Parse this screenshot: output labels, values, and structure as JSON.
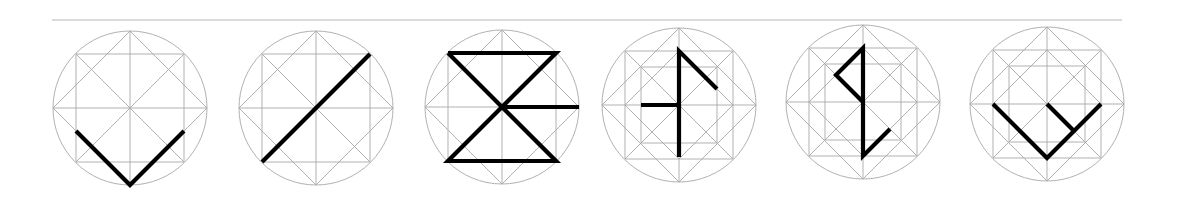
{
  "canvas": {
    "width": 1178,
    "height": 210
  },
  "colors": {
    "background": "#ffffff",
    "grid": "#a8a8a8",
    "stroke": "#000000",
    "rule": "#b8b8b8"
  },
  "rule": {
    "x1": 52,
    "x2": 1122,
    "y": 20
  },
  "glyph_style": {
    "radius": 77,
    "square_half": 54,
    "inner_square_half": 38
  },
  "glyphs": [
    {
      "id": "glyph-1",
      "cx": 130,
      "cy": 108,
      "grid": "basic",
      "strokes": [
        [
          [
            -54,
            23
          ],
          [
            0,
            77
          ],
          [
            54,
            23
          ]
        ]
      ]
    },
    {
      "id": "glyph-2",
      "cx": 316,
      "cy": 108,
      "grid": "basic",
      "strokes": [
        [
          [
            -54,
            54
          ],
          [
            54,
            -54
          ]
        ]
      ]
    },
    {
      "id": "glyph-3",
      "cx": 502,
      "cy": 107,
      "grid": "basic",
      "strokes": [
        [
          [
            -54,
            -54
          ],
          [
            54,
            -54
          ],
          [
            -54,
            54
          ],
          [
            54,
            54
          ],
          [
            -54,
            -54
          ]
        ],
        [
          [
            0,
            0
          ],
          [
            77,
            0
          ]
        ]
      ]
    },
    {
      "id": "glyph-4",
      "cx": 679,
      "cy": 105,
      "grid": "extended",
      "strokes": [
        [
          [
            0,
            52
          ],
          [
            0,
            -54
          ],
          [
            38,
            -16
          ]
        ],
        [
          [
            -38,
            0
          ],
          [
            0,
            0
          ]
        ]
      ]
    },
    {
      "id": "glyph-5",
      "cx": 863,
      "cy": 102,
      "grid": "extended",
      "strokes": [
        [
          [
            0,
            0
          ],
          [
            -27,
            -27
          ],
          [
            0,
            -54
          ],
          [
            0,
            54
          ],
          [
            27,
            27
          ]
        ]
      ]
    },
    {
      "id": "glyph-6",
      "cx": 1047,
      "cy": 104,
      "grid": "extended",
      "strokes": [
        [
          [
            -54,
            0
          ],
          [
            0,
            54
          ],
          [
            54,
            0
          ]
        ],
        [
          [
            0,
            0
          ],
          [
            27,
            27
          ]
        ]
      ]
    }
  ]
}
